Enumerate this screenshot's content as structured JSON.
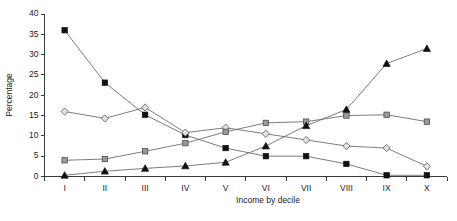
{
  "chart_data": {
    "type": "line",
    "title": "",
    "xlabel": "Income by decile",
    "ylabel": "Percentage",
    "categories": [
      "I",
      "II",
      "III",
      "IV",
      "V",
      "VI",
      "VII",
      "VIII",
      "IX",
      "X"
    ],
    "ylim": [
      0,
      40
    ],
    "yticks": [
      0,
      5,
      10,
      15,
      20,
      25,
      30,
      35,
      40
    ],
    "grid": false,
    "legend": "none",
    "series": [
      {
        "name": "filled-square",
        "marker": "filled-square",
        "color": "#111111",
        "values": [
          36.0,
          23.1,
          15.2,
          10.2,
          7.0,
          5.0,
          5.0,
          3.1,
          0.3,
          0.3
        ]
      },
      {
        "name": "open-diamond",
        "marker": "open-diamond",
        "color": "#e2e2e2",
        "values": [
          16.0,
          14.3,
          17.0,
          10.8,
          12.0,
          10.5,
          9.0,
          7.5,
          7.0,
          2.5
        ]
      },
      {
        "name": "grey-square",
        "marker": "grey-square",
        "color": "#9a9a9a",
        "values": [
          4.0,
          4.3,
          6.2,
          8.2,
          11.0,
          13.2,
          13.5,
          15.0,
          15.2,
          13.5
        ]
      },
      {
        "name": "filled-triangle",
        "marker": "filled-triangle",
        "color": "#111111",
        "values": [
          0.3,
          1.3,
          2.0,
          2.6,
          3.5,
          7.5,
          12.5,
          16.5,
          27.8,
          31.5
        ]
      }
    ]
  }
}
